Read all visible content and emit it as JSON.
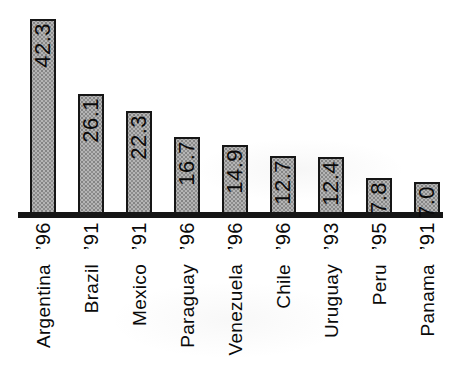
{
  "chart_data": {
    "type": "bar",
    "categories": [
      "Argentina",
      "Brazil",
      "Mexico",
      "Paraguay",
      "Venezuela",
      "Chile",
      "Uruguay",
      "Peru",
      "Panama"
    ],
    "year_labels": [
      "’96",
      "’91",
      "’91",
      "’96",
      "’96",
      "’96",
      "’93",
      "’95",
      "’91"
    ],
    "values": [
      42.3,
      26.1,
      22.3,
      16.7,
      14.9,
      12.7,
      12.4,
      7.8,
      7.0
    ],
    "value_labels": [
      "42.3",
      "26.1",
      "22.3",
      "16.7",
      "14.9",
      "12.7",
      "12.4",
      "7.8",
      "7.0"
    ],
    "title": "",
    "xlabel": "",
    "ylabel": "",
    "ylim": [
      0,
      43
    ],
    "grid": false,
    "legend": false,
    "y_axis_shown": false,
    "value_label_position": "inside-top",
    "label_rotation_deg": -90,
    "bar_fill_color": "#b5b5b5",
    "bar_stipple_color": "#848484",
    "bar_border_color": "#161616",
    "axis_line_color": "#151515",
    "text_color": "#0a0a0a",
    "background_color": "#ffffff"
  }
}
